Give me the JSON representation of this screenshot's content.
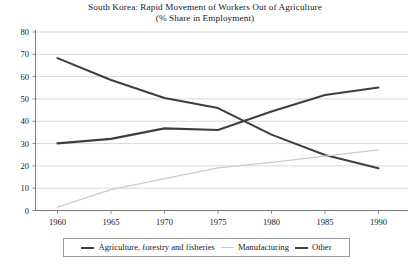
{
  "chart_data": {
    "type": "line",
    "title": "South Korea: Rapid Movement of Workers Out of Agriculture",
    "subtitle": "(% Share in Employment)",
    "xlabel": "",
    "ylabel": "",
    "xlim": [
      1958,
      1992
    ],
    "ylim": [
      0,
      80
    ],
    "xticks": [
      1960,
      1965,
      1970,
      1975,
      1980,
      1985,
      1990
    ],
    "yticks": [
      0,
      10,
      20,
      30,
      40,
      50,
      60,
      70,
      80
    ],
    "xtick_labels": [
      "1960",
      "1965",
      "1970",
      "1975",
      "1980",
      "1985",
      "1990"
    ],
    "ytick_labels": [
      "0",
      "10",
      "20",
      "30",
      "40",
      "50",
      "60",
      "70",
      "80"
    ],
    "grid": "horizontal",
    "legend_position": "bottom",
    "x": [
      1960,
      1965,
      1970,
      1975,
      1980,
      1985,
      1990
    ],
    "series": [
      {
        "name": "Agriculture, forestry and fisheries",
        "color": "#3f3f3f",
        "width": 2.1,
        "values": [
          68.3,
          58.5,
          50.4,
          45.9,
          34.0,
          24.9,
          18.9
        ]
      },
      {
        "name": "Manufacturing",
        "color": "#cccccc",
        "width": 1.3,
        "values": [
          1.5,
          9.4,
          14.3,
          19.1,
          21.6,
          24.4,
          27.2
        ]
      },
      {
        "name": "Other",
        "color": "#3f3f3f",
        "width": 2.1,
        "values": [
          30.1,
          32.1,
          36.8,
          36.1,
          44.4,
          51.8,
          55.1
        ]
      }
    ],
    "notes": {
      "crossover_year": 1977.5,
      "crossover_value": 40
    }
  },
  "legend": {
    "items": [
      {
        "label": "Agriculture, forestry and fisheries",
        "color": "#3f3f3f",
        "thickness": "2.2px"
      },
      {
        "label": "Manufacturing",
        "color": "#cccccc",
        "thickness": "1.4px"
      },
      {
        "label": "Other",
        "color": "#3f3f3f",
        "thickness": "2.2px"
      }
    ]
  },
  "colors": {
    "background": "#ffffff",
    "gridline": "#c9c9c9",
    "axis": "#6e6e6e",
    "text": "#1a1a1a",
    "dark_series": "#3f3f3f",
    "light_series": "#cccccc"
  }
}
